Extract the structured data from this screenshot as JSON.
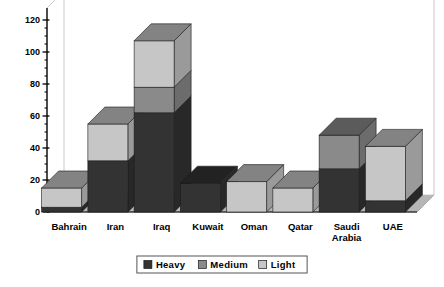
{
  "chart_data": {
    "type": "bar",
    "title": "",
    "subtitle": "",
    "xlabel": "",
    "ylabel": "",
    "stacked": true,
    "three_d": true,
    "grid": false,
    "ylim": [
      0,
      120
    ],
    "yticks": [
      0,
      20,
      40,
      60,
      80,
      100,
      120
    ],
    "ytick_labels": [
      "0",
      "20",
      "40",
      "60",
      "80",
      "100",
      "120"
    ],
    "minor_tick_step": 5,
    "legend_position": "bottom",
    "categories": [
      "Bahrain",
      "Iran",
      "Iraq",
      "Kuwait",
      "Oman",
      "Qatar",
      "Saudi Arabia",
      "UAE"
    ],
    "series": [
      {
        "name": "Heavy",
        "color": "#333333",
        "values": [
          3,
          32,
          62,
          18,
          0,
          0,
          27,
          7
        ]
      },
      {
        "name": "Medium",
        "color": "#8a8a8a",
        "values": [
          0,
          0,
          16,
          0,
          0,
          0,
          21,
          0
        ]
      },
      {
        "name": "Light",
        "color": "#c6c6c6",
        "values": [
          12,
          23,
          29,
          0,
          19,
          15,
          0,
          34
        ]
      }
    ],
    "totals": [
      15,
      55,
      107,
      18,
      19,
      15,
      48,
      41
    ]
  },
  "legend": {
    "items": [
      {
        "label": "Heavy",
        "swatch": "#333333"
      },
      {
        "label": "Medium",
        "swatch": "#8a8a8a"
      },
      {
        "label": "Light",
        "swatch": "#c6c6c6"
      }
    ]
  },
  "colors": {
    "heavy": "#333333",
    "medium": "#8a8a8a",
    "light": "#c6c6c6",
    "floor": "#b5b5b5",
    "back_wall": "#ffffff",
    "frame": "#c9c9c9",
    "axis": "#000000",
    "text": "#000000"
  },
  "axis": {
    "tick_labels": [
      "120",
      "100",
      "80",
      "60",
      "40",
      "20",
      "0"
    ]
  }
}
